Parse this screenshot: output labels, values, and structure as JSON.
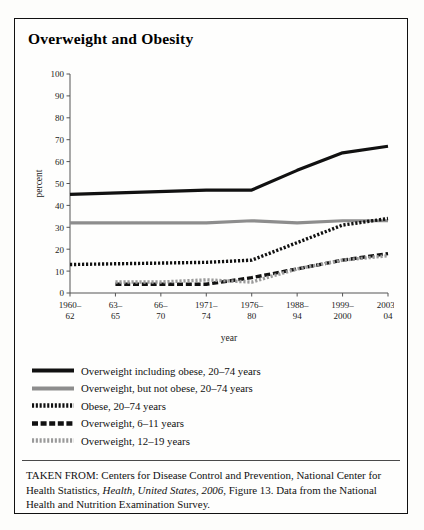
{
  "figure": {
    "title": "Overweight and Obesity",
    "source_note_prefix": "TAKEN FROM: Centers for Disease Control and Prevention, National Center for Health Statistics, ",
    "source_note_italic": "Health, United States, 2006",
    "source_note_suffix": ", Figure 13. Data from the National Health and Nutrition Examination Survey."
  },
  "legend": {
    "items": [
      {
        "label": "Overweight including obese, 20–74 years",
        "style": "solid",
        "color": "#111111"
      },
      {
        "label": "Overweight, but not obese, 20–74 years",
        "style": "solid",
        "color": "#8d8d8d"
      },
      {
        "label": "Obese, 20–74 years",
        "style": "dotted",
        "color": "#111111"
      },
      {
        "label": "Overweight, 6–11 years",
        "style": "dashed",
        "color": "#111111"
      },
      {
        "label": "Overweight, 12–19 years",
        "style": "dotted",
        "color": "#9a9a9a"
      }
    ]
  },
  "chart_data": {
    "type": "line",
    "title": "Overweight and Obesity",
    "xlabel": "year",
    "ylabel": "percent",
    "ylim": [
      0,
      100
    ],
    "yticks": [
      0,
      10,
      20,
      30,
      40,
      50,
      60,
      70,
      80,
      90,
      100
    ],
    "grid": false,
    "legend_position": "below",
    "categories": [
      "1960–62",
      "63–65",
      "66–70",
      "1971–74",
      "1976–80",
      "1988–94",
      "1999–2000",
      "2003–04"
    ],
    "category_lines": [
      [
        "1960–",
        "62"
      ],
      [
        "63–",
        "65"
      ],
      [
        "66–",
        "70"
      ],
      [
        "1971–",
        "74"
      ],
      [
        "1976–",
        "80"
      ],
      [
        "1988–",
        "94"
      ],
      [
        "1999–",
        "2000"
      ],
      [
        "2003–",
        "04"
      ]
    ],
    "series": [
      {
        "name": "Overweight including obese, 20–74 years",
        "color": "#111111",
        "style": "solid",
        "values": [
          45,
          null,
          null,
          47,
          47,
          56,
          64,
          67
        ]
      },
      {
        "name": "Overweight, but not obese, 20–74 years",
        "color": "#8d8d8d",
        "style": "solid",
        "values": [
          32,
          null,
          null,
          32,
          33,
          32,
          33,
          33
        ]
      },
      {
        "name": "Obese, 20–74 years",
        "color": "#111111",
        "style": "dotted",
        "values": [
          13,
          null,
          null,
          14,
          15,
          23,
          31,
          34
        ]
      },
      {
        "name": "Overweight, 6–11 years",
        "color": "#111111",
        "style": "dashed",
        "values": [
          null,
          4,
          4,
          4,
          7,
          11,
          15,
          18
        ]
      },
      {
        "name": "Overweight, 12–19 years",
        "color": "#9a9a9a",
        "style": "dotted",
        "values": [
          null,
          5,
          5,
          6,
          5,
          11,
          15,
          17
        ]
      }
    ]
  }
}
